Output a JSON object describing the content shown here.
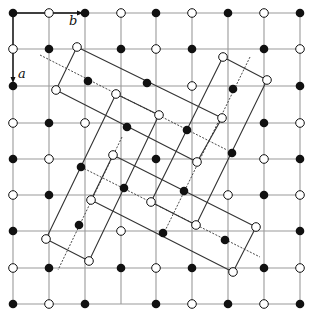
{
  "labels": {
    "a": "a",
    "b": "b"
  },
  "colors": {
    "grid": "#9a9a9a",
    "point": "#111111",
    "line": "#333333",
    "background": "#ffffff"
  },
  "grid": {
    "x": [
      13,
      49,
      85,
      121,
      156,
      192,
      228,
      264,
      300
    ],
    "y": [
      13,
      49,
      86,
      123,
      159,
      195,
      231,
      268,
      304
    ]
  },
  "lattice_points": [
    {
      "x": 13,
      "y": 13,
      "t": "f"
    },
    {
      "x": 49,
      "y": 13,
      "t": "o"
    },
    {
      "x": 85,
      "y": 13,
      "t": "f"
    },
    {
      "x": 121,
      "y": 13,
      "t": "o"
    },
    {
      "x": 156,
      "y": 13,
      "t": "f"
    },
    {
      "x": 192,
      "y": 13,
      "t": "o"
    },
    {
      "x": 228,
      "y": 13,
      "t": "f"
    },
    {
      "x": 264,
      "y": 13,
      "t": "o"
    },
    {
      "x": 300,
      "y": 13,
      "t": "f"
    },
    {
      "x": 13,
      "y": 49,
      "t": "o"
    },
    {
      "x": 49,
      "y": 49,
      "t": "f"
    },
    {
      "x": 121,
      "y": 49,
      "t": "f"
    },
    {
      "x": 156,
      "y": 49,
      "t": "o"
    },
    {
      "x": 192,
      "y": 49,
      "t": "f"
    },
    {
      "x": 264,
      "y": 49,
      "t": "f"
    },
    {
      "x": 300,
      "y": 49,
      "t": "o"
    },
    {
      "x": 13,
      "y": 86,
      "t": "f"
    },
    {
      "x": 192,
      "y": 86,
      "t": "o"
    },
    {
      "x": 300,
      "y": 86,
      "t": "f"
    },
    {
      "x": 13,
      "y": 123,
      "t": "o"
    },
    {
      "x": 49,
      "y": 123,
      "t": "f"
    },
    {
      "x": 85,
      "y": 123,
      "t": "o"
    },
    {
      "x": 264,
      "y": 123,
      "t": "f"
    },
    {
      "x": 300,
      "y": 123,
      "t": "o"
    },
    {
      "x": 13,
      "y": 159,
      "t": "f"
    },
    {
      "x": 49,
      "y": 159,
      "t": "o"
    },
    {
      "x": 156,
      "y": 159,
      "t": "f"
    },
    {
      "x": 264,
      "y": 159,
      "t": "o"
    },
    {
      "x": 300,
      "y": 159,
      "t": "f"
    },
    {
      "x": 13,
      "y": 195,
      "t": "o"
    },
    {
      "x": 49,
      "y": 195,
      "t": "f"
    },
    {
      "x": 228,
      "y": 195,
      "t": "o"
    },
    {
      "x": 264,
      "y": 195,
      "t": "f"
    },
    {
      "x": 300,
      "y": 195,
      "t": "o"
    },
    {
      "x": 13,
      "y": 231,
      "t": "f"
    },
    {
      "x": 121,
      "y": 231,
      "t": "o"
    },
    {
      "x": 300,
      "y": 231,
      "t": "f"
    },
    {
      "x": 13,
      "y": 268,
      "t": "o"
    },
    {
      "x": 49,
      "y": 268,
      "t": "f"
    },
    {
      "x": 121,
      "y": 268,
      "t": "f"
    },
    {
      "x": 156,
      "y": 268,
      "t": "o"
    },
    {
      "x": 192,
      "y": 268,
      "t": "f"
    },
    {
      "x": 264,
      "y": 268,
      "t": "f"
    },
    {
      "x": 300,
      "y": 268,
      "t": "o"
    },
    {
      "x": 13,
      "y": 304,
      "t": "f"
    },
    {
      "x": 49,
      "y": 304,
      "t": "o"
    },
    {
      "x": 85,
      "y": 304,
      "t": "f"
    },
    {
      "x": 156,
      "y": 304,
      "t": "f"
    },
    {
      "x": 192,
      "y": 304,
      "t": "o"
    },
    {
      "x": 228,
      "y": 304,
      "t": "f"
    },
    {
      "x": 264,
      "y": 304,
      "t": "o"
    },
    {
      "x": 300,
      "y": 304,
      "t": "f"
    }
  ],
  "displaced_points": [
    {
      "x": 77,
      "y": 47,
      "t": "o"
    },
    {
      "x": 56,
      "y": 90,
      "t": "o"
    },
    {
      "x": 116,
      "y": 94,
      "t": "o"
    },
    {
      "x": 159,
      "y": 115,
      "t": "o"
    },
    {
      "x": 222,
      "y": 118,
      "t": "o"
    },
    {
      "x": 197,
      "y": 162,
      "t": "o"
    },
    {
      "x": 113,
      "y": 155,
      "t": "o"
    },
    {
      "x": 91,
      "y": 200,
      "t": "o"
    },
    {
      "x": 151,
      "y": 202,
      "t": "o"
    },
    {
      "x": 196,
      "y": 225,
      "t": "o"
    },
    {
      "x": 256,
      "y": 227,
      "t": "o"
    },
    {
      "x": 46,
      "y": 239,
      "t": "o"
    },
    {
      "x": 89,
      "y": 261,
      "t": "o"
    },
    {
      "x": 233,
      "y": 272,
      "t": "o"
    },
    {
      "x": 223,
      "y": 57,
      "t": "o"
    },
    {
      "x": 267,
      "y": 80,
      "t": "o"
    },
    {
      "x": 88,
      "y": 81,
      "t": "f"
    },
    {
      "x": 147,
      "y": 83,
      "t": "f"
    },
    {
      "x": 233,
      "y": 89,
      "t": "f"
    },
    {
      "x": 127,
      "y": 127,
      "t": "f"
    },
    {
      "x": 187,
      "y": 130,
      "t": "f"
    },
    {
      "x": 232,
      "y": 153,
      "t": "f"
    },
    {
      "x": 81,
      "y": 167,
      "t": "f"
    },
    {
      "x": 124,
      "y": 188,
      "t": "f"
    },
    {
      "x": 184,
      "y": 191,
      "t": "f"
    },
    {
      "x": 79,
      "y": 225,
      "t": "f"
    },
    {
      "x": 163,
      "y": 233,
      "t": "f"
    },
    {
      "x": 225,
      "y": 240,
      "t": "f"
    }
  ],
  "rectangles": [
    {
      "pts": "77,47 222,118 197,162 56,90"
    },
    {
      "pts": "223,57 267,80 196,225 151,202"
    },
    {
      "pts": "116,94 159,115 89,261 46,239"
    },
    {
      "pts": "113,155 256,227 233,272 91,200"
    }
  ],
  "dashed_lines": [
    {
      "x1": 40,
      "y1": 55,
      "x2": 227,
      "y2": 150
    },
    {
      "x1": 81,
      "y1": 167,
      "x2": 260,
      "y2": 257
    },
    {
      "x1": 250,
      "y1": 57,
      "x2": 162,
      "y2": 237
    },
    {
      "x1": 122,
      "y1": 137,
      "x2": 58,
      "y2": 270
    }
  ]
}
